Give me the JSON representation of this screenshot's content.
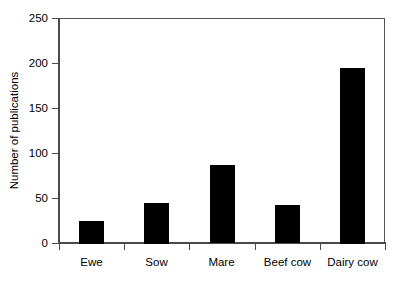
{
  "chart_data": {
    "type": "bar",
    "title": "",
    "subtitle": "",
    "xlabel": "",
    "ylabel": "Number of publications",
    "categories": [
      "Ewe",
      "Sow",
      "Mare",
      "Beef cow",
      "Dairy cow"
    ],
    "values": [
      25,
      45,
      87,
      42,
      195
    ],
    "series": [
      {
        "name": "Number of publications",
        "values": [
          25,
          45,
          87,
          42,
          195
        ],
        "color": "#000000"
      }
    ],
    "ylim": [
      0,
      250
    ],
    "yticks": [
      0,
      50,
      100,
      150,
      200,
      250
    ],
    "ytick_labels": [
      "0",
      "50",
      "100",
      "150",
      "200",
      "250"
    ],
    "grid": false,
    "legend": false,
    "legend_position": "none",
    "bar_color": "#000000",
    "axis_color": "#4a4a4a",
    "background_color": "#ffffff",
    "annotations": []
  },
  "figure": {
    "y_axis_title": "Number of publications",
    "tick_labels_y": [
      "250",
      "200",
      "150",
      "100",
      "50",
      "0"
    ],
    "tick_labels_x": [
      "Ewe",
      "Sow",
      "Mare",
      "Beef cow",
      "Dairy cow"
    ]
  }
}
